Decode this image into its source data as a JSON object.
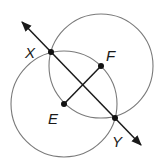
{
  "diagram": {
    "type": "geometry-construction",
    "colors": {
      "circle": "#7a7a7a",
      "line": "#1a1a1a",
      "point": "#111111",
      "background": "#ffffff"
    },
    "points": [
      {
        "id": "X",
        "label": "X",
        "x": 51,
        "y": 52,
        "label_x": 25,
        "label_y": 58
      },
      {
        "id": "F",
        "label": "F",
        "x": 101,
        "y": 66,
        "label_x": 106,
        "label_y": 61
      },
      {
        "id": "E",
        "label": "E",
        "x": 64,
        "y": 104,
        "label_x": 48,
        "label_y": 124
      },
      {
        "id": "Y",
        "label": "Y",
        "x": 115,
        "y": 118,
        "label_x": 112,
        "label_y": 147
      }
    ],
    "circles": [
      {
        "id": "circle-E",
        "center": "E",
        "cx": 64,
        "cy": 104,
        "r": 53
      },
      {
        "id": "circle-F",
        "center": "F",
        "cx": 101,
        "cy": 66,
        "r": 52
      }
    ],
    "line_XY": {
      "x1": 22,
      "y1": 22,
      "x2": 141,
      "y2": 145,
      "arrows": "both"
    },
    "segment_EF": {
      "from": "E",
      "to": "F"
    }
  }
}
